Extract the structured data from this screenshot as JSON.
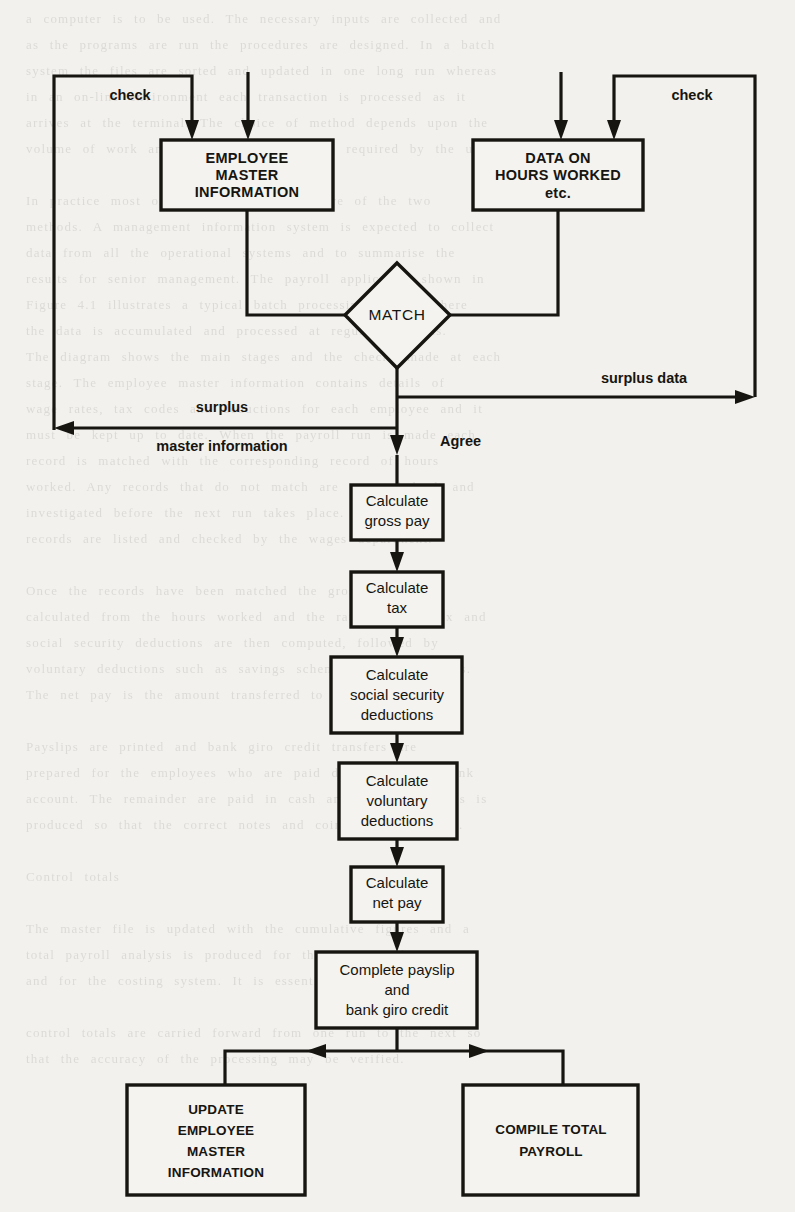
{
  "diagram": {
    "type": "flowchart",
    "colors": {
      "ink": "#17150f",
      "paper": "#f2f1ee"
    },
    "nodes": {
      "employee_master": {
        "shape": "process",
        "lines": [
          "EMPLOYEE",
          "MASTER",
          "INFORMATION"
        ]
      },
      "hours_data": {
        "shape": "process",
        "lines": [
          "DATA ON",
          "HOURS WORKED",
          "etc."
        ]
      },
      "match": {
        "shape": "decision",
        "label": "MATCH"
      },
      "gross_pay": {
        "shape": "process",
        "lines": [
          "Calculate",
          "gross pay"
        ]
      },
      "tax": {
        "shape": "process",
        "lines": [
          "Calculate",
          "tax"
        ]
      },
      "social_security": {
        "shape": "process",
        "lines": [
          "Calculate",
          "social security",
          "deductions"
        ]
      },
      "voluntary": {
        "shape": "process",
        "lines": [
          "Calculate",
          "voluntary",
          "deductions"
        ]
      },
      "net_pay": {
        "shape": "process",
        "lines": [
          "Calculate",
          "net pay"
        ]
      },
      "payslip": {
        "shape": "process",
        "lines": [
          "Complete payslip",
          "and",
          "bank giro credit"
        ]
      },
      "update_master": {
        "shape": "process",
        "lines": [
          "UPDATE",
          "EMPLOYEE",
          "MASTER",
          "INFORMATION"
        ]
      },
      "compile_payroll": {
        "shape": "process",
        "lines": [
          "COMPILE TOTAL",
          "PAYROLL"
        ]
      }
    },
    "edge_labels": {
      "check_left": "check",
      "check_right": "check",
      "agree": "Agree",
      "surplus": "surplus",
      "master_information": "master information",
      "surplus_data": "surplus data"
    }
  },
  "background_text": {
    "lines": [
      "a computer is to be used. The necessary inputs are collected and",
      "as the programs are run the procedures are designed. In a batch",
      "system the files are sorted and updated in one long run whereas",
      "in an on-line environment each transaction is processed as it",
      "arrives at the terminal. The choice of method depends upon the",
      "volume of work and the speed of response required by the users.",
      "",
      "In practice most organisations use a mixture of the two",
      "methods. A management information system is expected to collect",
      "data from all the operational systems and to summarise the",
      "results for senior management. The payroll application shown in",
      "Figure 4.1 illustrates a typical batch processing system where",
      "the data is accumulated and processed at regular intervals.",
      "The diagram shows the main stages and the checks made at each",
      "stage. The employee master information contains details of",
      "wage rates, tax codes and deductions for each employee and it",
      "must be kept up to date. When the payroll run is made each",
      "record is matched with the corresponding record of hours",
      "worked. Any records that do not match are reported back and",
      "investigated before the next run takes place. The surplus",
      "records are listed and checked by the wages department.",
      "",
      "Once the records have been matched the gross pay is",
      "calculated from the hours worked and the rate of pay. Tax and",
      "social security deductions are then computed, followed by",
      "voluntary deductions such as savings schemes and union dues.",
      "The net pay is the amount transferred to the bank.",
      "",
      "Payslips are printed and bank giro credit transfers are",
      "prepared for the employees who are paid directly into a bank",
      "account. The remainder are paid in cash and a coin analysis is",
      "produced so that the correct notes and coins may be drawn.",
      "",
      "Control totals",
      "",
      "The master file is updated with the cumulative figures and a",
      "total payroll analysis is produced for the accounts department",
      "and for the costing system. It is essential that",
      "",
      "control totals are carried forward from one run to the next so",
      "that the accuracy of the processing may be verified."
    ]
  }
}
